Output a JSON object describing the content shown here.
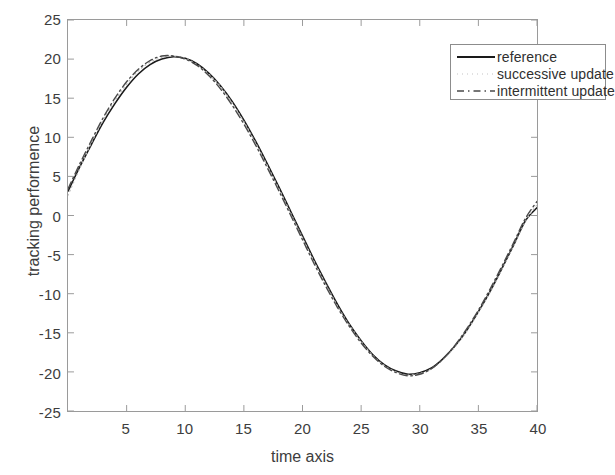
{
  "chart_data": {
    "type": "line",
    "title": "",
    "xlabel": "time axis",
    "ylabel": "tracking performence",
    "xlim": [
      0,
      40
    ],
    "ylim": [
      -25,
      25
    ],
    "xticks": [
      5,
      10,
      15,
      20,
      25,
      30,
      35,
      40
    ],
    "yticks": [
      25,
      20,
      15,
      10,
      5,
      0,
      -5,
      -10,
      -15,
      -20,
      -25
    ],
    "xtick_labels": [
      "5",
      "10",
      "15",
      "20",
      "25",
      "30",
      "35",
      "40"
    ],
    "ytick_labels": [
      "25",
      "20",
      "15",
      "10",
      "5",
      "0",
      "-5",
      "-10",
      "-15",
      "-20",
      "-25"
    ],
    "grid": false,
    "box": true,
    "tick_direction": "in",
    "legend_position": "top-right",
    "axis_color": "#9a9a9a",
    "background": "#ffffff",
    "series": [
      {
        "name": "reference",
        "style": "solid",
        "color": "#1a1a1a",
        "width": 1.6,
        "x": [
          0,
          1,
          2,
          3,
          4,
          5,
          6,
          7,
          8,
          9,
          10,
          11,
          12,
          13,
          14,
          15,
          16,
          17,
          18,
          19,
          20,
          21,
          22,
          23,
          24,
          25,
          26,
          27,
          28,
          29,
          30,
          31,
          32,
          33,
          34,
          35,
          36,
          37,
          38,
          39,
          40
        ],
        "values": [
          3.1,
          6.2,
          9.1,
          11.9,
          14.3,
          16.4,
          18.1,
          19.3,
          20.0,
          20.3,
          20.1,
          19.4,
          18.2,
          16.6,
          14.6,
          12.2,
          9.5,
          6.6,
          3.6,
          0.5,
          -2.6,
          -5.7,
          -8.6,
          -11.4,
          -13.9,
          -16.0,
          -17.8,
          -19.1,
          -19.9,
          -20.3,
          -20.1,
          -19.5,
          -18.3,
          -16.7,
          -14.7,
          -12.3,
          -9.7,
          -6.8,
          -3.8,
          -0.7,
          1.0
        ]
      },
      {
        "name": "successive update",
        "style": "dotted",
        "color": "#b9b9b9",
        "width": 1.2,
        "x": [
          0,
          1,
          2,
          3,
          4,
          5,
          6,
          7,
          8,
          9,
          10,
          11,
          12,
          13,
          14,
          15,
          16,
          17,
          18,
          19,
          20,
          21,
          22,
          23,
          24,
          25,
          26,
          27,
          28,
          29,
          30,
          31,
          32,
          33,
          34,
          35,
          36,
          37,
          38,
          39,
          40
        ],
        "values": [
          2.6,
          6.0,
          9.3,
          12.2,
          14.7,
          16.8,
          18.5,
          19.6,
          20.2,
          20.4,
          20.1,
          19.3,
          18.1,
          16.5,
          14.4,
          12.0,
          9.3,
          6.4,
          3.4,
          0.3,
          -2.8,
          -5.9,
          -8.8,
          -11.6,
          -14.0,
          -16.1,
          -17.9,
          -19.2,
          -20.0,
          -20.4,
          -20.2,
          -19.6,
          -18.4,
          -16.8,
          -14.8,
          -12.4,
          -9.8,
          -6.9,
          -3.9,
          -0.8,
          1.4
        ]
      },
      {
        "name": "intermittent update",
        "style": "dashdot",
        "color": "#4a4a4a",
        "width": 1.4,
        "x": [
          0,
          1,
          2,
          3,
          4,
          5,
          6,
          7,
          8,
          9,
          10,
          11,
          12,
          13,
          14,
          15,
          16,
          17,
          18,
          19,
          20,
          21,
          22,
          23,
          24,
          25,
          26,
          27,
          28,
          29,
          30,
          31,
          32,
          33,
          34,
          35,
          36,
          37,
          38,
          39,
          40
        ],
        "values": [
          3.4,
          6.6,
          9.6,
          12.5,
          15.0,
          17.1,
          18.7,
          19.8,
          20.4,
          20.4,
          20.0,
          19.2,
          17.9,
          16.2,
          14.1,
          11.7,
          9.0,
          6.1,
          3.1,
          0.0,
          -3.1,
          -6.2,
          -9.1,
          -11.8,
          -14.2,
          -16.3,
          -18.0,
          -19.3,
          -20.1,
          -20.5,
          -20.3,
          -19.6,
          -18.3,
          -16.6,
          -14.5,
          -12.1,
          -9.4,
          -6.5,
          -3.5,
          -0.4,
          1.8
        ]
      }
    ]
  },
  "legend": {
    "entries": [
      {
        "label": "reference",
        "style": "solid"
      },
      {
        "label": "successive update",
        "style": "dotted"
      },
      {
        "label": "intermittent update",
        "style": "dashdot"
      }
    ]
  }
}
